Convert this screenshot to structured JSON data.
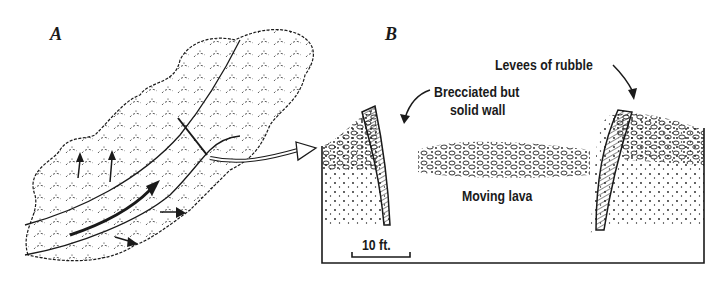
{
  "figure": {
    "panel_a": {
      "label": "A",
      "description": "Plan view of a lava flow channel with flow arrows"
    },
    "panel_b": {
      "label": "B",
      "annotations": {
        "levees": "Levees of rubble",
        "wall_line1": "Brecciated but",
        "wall_line2": "solid wall",
        "center": "Moving lava",
        "scale": "10 ft."
      }
    }
  },
  "colors": {
    "ink": "#1a1a1a",
    "background": "#ffffff"
  }
}
